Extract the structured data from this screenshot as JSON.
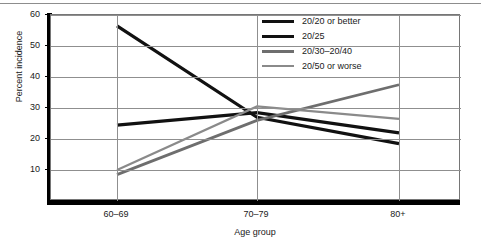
{
  "chart_data": {
    "type": "line",
    "title": "",
    "xlabel": "Age group",
    "ylabel": "Percent incidence",
    "categories": [
      "60–69",
      "70–79",
      "80+"
    ],
    "yticks": [
      10,
      20,
      30,
      40,
      50,
      60
    ],
    "ylim": [
      0,
      60
    ],
    "grid": true,
    "legend_position": "top-right",
    "series": [
      {
        "name": "20/20 or better",
        "values": [
          56.5,
          27.0,
          18.5
        ],
        "color": "#111111",
        "width": 3.2
      },
      {
        "name": "20/25",
        "values": [
          24.5,
          28.5,
          22.0
        ],
        "color": "#111111",
        "width": 3.2
      },
      {
        "name": "20/30–20/40",
        "values": [
          8.5,
          26.0,
          37.5
        ],
        "color": "#6e6e6e",
        "width": 2.8
      },
      {
        "name": "20/50 or worse",
        "values": [
          10.0,
          30.5,
          26.5
        ],
        "color": "#8a8a8a",
        "width": 2.2
      }
    ]
  },
  "axes": {
    "y_title": "Percent incidence",
    "x_title": "Age group",
    "y_tick_labels": [
      "10",
      "20",
      "30",
      "40",
      "50",
      "60"
    ],
    "x_tick_labels": [
      "60–69",
      "70–79",
      "80+"
    ]
  },
  "legend": {
    "items": [
      {
        "label": "20/20 or better"
      },
      {
        "label": "20/25"
      },
      {
        "label": "20/30–20/40"
      },
      {
        "label": "20/50 or worse"
      }
    ]
  }
}
